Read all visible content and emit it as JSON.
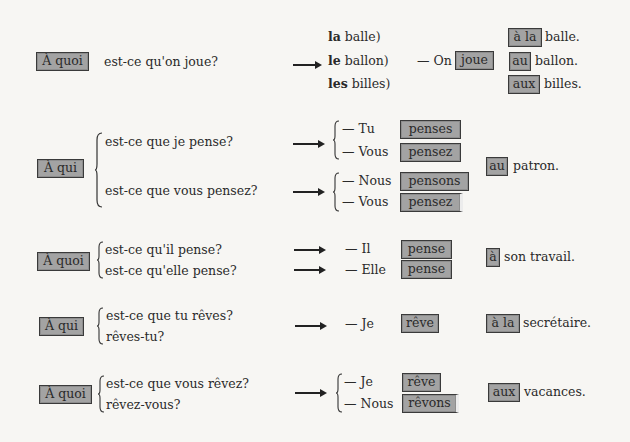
{
  "sections": [
    {
      "interrogative": "À quoi",
      "questions": [
        "est-ce qu'on joue?"
      ],
      "articles": [
        "(la balle)",
        "(le ballon)",
        "(les billes)"
      ],
      "articles_bold": [
        "la",
        "le",
        "les"
      ],
      "articles_rest": [
        " balle)",
        " ballon)",
        " billes)"
      ],
      "answer_subject": "— On",
      "answer_verb": "joue",
      "prepositions": [
        "à la",
        "au",
        "aux"
      ],
      "complements": [
        "balle.",
        "ballon.",
        "billes."
      ]
    },
    {
      "interrogative": "À qui",
      "questions": [
        "est-ce que je pense?",
        "est-ce que vous pensez?"
      ],
      "answers": [
        {
          "subject": "— Tu",
          "verb": "penses"
        },
        {
          "subject": "— Vous",
          "verb": "pensez"
        },
        {
          "subject": "— Nous",
          "verb": "pensons"
        },
        {
          "subject": "— Vous",
          "verb": "pensez"
        }
      ],
      "preposition": "au",
      "complement": "patron."
    },
    {
      "interrogative": "À quoi",
      "questions": [
        "est-ce qu'il pense?",
        "est-ce qu'elle pense?"
      ],
      "answers": [
        {
          "subject": "— Il",
          "verb": "pense"
        },
        {
          "subject": "— Elle",
          "verb": "pense"
        }
      ],
      "preposition": "à",
      "complement": "son travail."
    },
    {
      "interrogative": "À qui",
      "questions": [
        "est-ce que tu rêves?",
        "rêves-tu?"
      ],
      "answers": [
        {
          "subject": "— Je",
          "verb": "rêve"
        }
      ],
      "preposition": "à la",
      "complement": "secrétaire."
    },
    {
      "interrogative": "À quoi",
      "questions": [
        "est-ce que vous rêvez?",
        "rêvez-vous?"
      ],
      "answers": [
        {
          "subject": "— Je",
          "verb": "rêve"
        },
        {
          "subject": "— Nous",
          "verb": "rêvons"
        }
      ],
      "preposition": "aux",
      "complement": "vacances."
    }
  ],
  "colors": {
    "background": "#f7f6f3",
    "box_fill": "#a3a3a3",
    "box_border": "#3a3a3a",
    "text": "#2a2a2a"
  }
}
